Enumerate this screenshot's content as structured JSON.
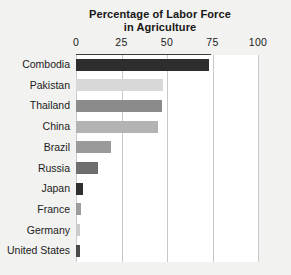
{
  "chart_data": {
    "type": "bar",
    "orientation": "horizontal",
    "title": "Percentage of Labor Force in Agriculture",
    "title_line1": "Percentage of Labor Force",
    "title_line2": "in Agriculture",
    "xlabel": "",
    "ylabel": "",
    "xlim": [
      0,
      100
    ],
    "grid": true,
    "legend": "none",
    "axis_position": "top",
    "tick_labels": [
      "0",
      "25",
      "50",
      "75",
      "100"
    ],
    "tick_values": [
      0,
      25,
      50,
      75,
      100
    ],
    "categories": [
      "Combodia",
      "Pakistan",
      "Thailand",
      "China",
      "Brazil",
      "Russia",
      "Japan",
      "France",
      "Germany",
      "United States"
    ],
    "values": [
      73,
      48,
      47,
      45,
      19,
      12,
      4,
      3,
      2,
      2
    ],
    "bar_colors": [
      "#2d2d2d",
      "#d8d8d8",
      "#8b8b8b",
      "#b3b3b3",
      "#9a9a9a",
      "#6e6e6e",
      "#2f2f2f",
      "#9d9d9d",
      "#cccccc",
      "#4a4a4a"
    ],
    "bars": [
      {
        "label": "Combodia",
        "value": 73,
        "color": "#2d2d2d"
      },
      {
        "label": "Pakistan",
        "value": 48,
        "color": "#d8d8d8"
      },
      {
        "label": "Thailand",
        "value": 47,
        "color": "#8b8b8b"
      },
      {
        "label": "China",
        "value": 45,
        "color": "#b3b3b3"
      },
      {
        "label": "Brazil",
        "value": 19,
        "color": "#9a9a9a"
      },
      {
        "label": "Russia",
        "value": 12,
        "color": "#6e6e6e"
      },
      {
        "label": "Japan",
        "value": 4,
        "color": "#2f2f2f"
      },
      {
        "label": "France",
        "value": 3,
        "color": "#9d9d9d"
      },
      {
        "label": "Germany",
        "value": 2,
        "color": "#cccccc"
      },
      {
        "label": "United States",
        "value": 2,
        "color": "#4a4a4a"
      }
    ]
  },
  "colors": {
    "background": "#f2f2f0",
    "plot_background": "#ffffff",
    "gridline": "#c9c9c9",
    "axis_rule": "#3c3c3c",
    "text": "#1b1b1b"
  }
}
